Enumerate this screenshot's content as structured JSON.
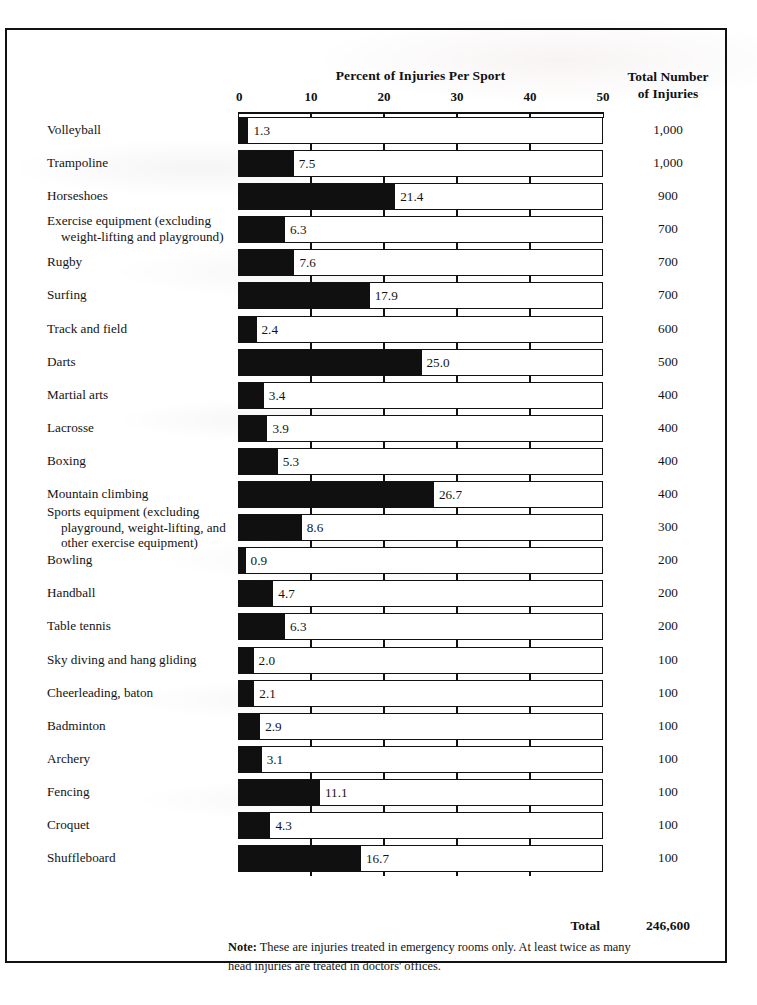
{
  "header": {
    "chart_title": "Percent of Injuries Per Sport",
    "right_column_line1": "Total Number",
    "right_column_line2": "of Injuries"
  },
  "footer": {
    "total_label": "Total",
    "total_value": "246,600",
    "note_prefix": "Note:",
    "note_text": " These are injuries treated in emergency rooms only. At least twice as many head injuries are treated in doctors' offices."
  },
  "chart_data": {
    "type": "bar",
    "title": "Percent of Injuries Per Sport",
    "xlabel": "",
    "ylabel": "",
    "xlim": [
      0,
      50
    ],
    "xticks": [
      0,
      10,
      20,
      30,
      40,
      50
    ],
    "xtick_labels": [
      "0",
      "10",
      "20",
      "30",
      "40",
      "50"
    ],
    "grid": false,
    "legend": "none",
    "orientation": "horizontal",
    "bar_color": "#101010",
    "track_color": "#ffffff",
    "value_series_name": "Percent of Injuries Per Sport",
    "secondary_series_name": "Total Number of Injuries",
    "categories": [
      "Volleyball",
      "Trampoline",
      "Horseshoes",
      "Exercise equipment (excluding weight-lifting and playground)",
      "Rugby",
      "Surfing",
      "Track and field",
      "Darts",
      "Martial arts",
      "Lacrosse",
      "Boxing",
      "Mountain climbing",
      "Sports equipment (excluding playground, weight-lifting, and other exercise equipment)",
      "Bowling",
      "Handball",
      "Table tennis",
      "Sky diving and hang gliding",
      "Cheerleading, baton",
      "Badminton",
      "Archery",
      "Fencing",
      "Croquet",
      "Shuffleboard"
    ],
    "values": [
      1.3,
      7.5,
      21.4,
      6.3,
      7.6,
      17.9,
      2.4,
      25.0,
      3.4,
      3.9,
      5.3,
      26.7,
      8.6,
      0.9,
      4.7,
      6.3,
      2.0,
      2.1,
      2.9,
      3.1,
      11.1,
      4.3,
      16.7
    ],
    "totals": [
      1000,
      1000,
      900,
      700,
      700,
      700,
      600,
      500,
      400,
      400,
      400,
      400,
      300,
      200,
      200,
      200,
      100,
      100,
      100,
      100,
      100,
      100,
      100
    ],
    "total_sum": 246600
  },
  "rows": [
    {
      "label_lines": [
        "Volleyball"
      ],
      "value": "1.3",
      "pct": 1.3,
      "total": "1,000"
    },
    {
      "label_lines": [
        "Trampoline"
      ],
      "value": "7.5",
      "pct": 7.5,
      "total": "1,000"
    },
    {
      "label_lines": [
        "Horseshoes"
      ],
      "value": "21.4",
      "pct": 21.4,
      "total": "900"
    },
    {
      "label_lines": [
        "Exercise equipment (excluding",
        "weight-lifting and playground)"
      ],
      "value": "6.3",
      "pct": 6.3,
      "total": "700"
    },
    {
      "label_lines": [
        "Rugby"
      ],
      "value": "7.6",
      "pct": 7.6,
      "total": "700"
    },
    {
      "label_lines": [
        "Surfing"
      ],
      "value": "17.9",
      "pct": 17.9,
      "total": "700"
    },
    {
      "label_lines": [
        "Track and field"
      ],
      "value": "2.4",
      "pct": 2.4,
      "total": "600"
    },
    {
      "label_lines": [
        "Darts"
      ],
      "value": "25.0",
      "pct": 25.0,
      "total": "500"
    },
    {
      "label_lines": [
        "Martial arts"
      ],
      "value": "3.4",
      "pct": 3.4,
      "total": "400"
    },
    {
      "label_lines": [
        "Lacrosse"
      ],
      "value": "3.9",
      "pct": 3.9,
      "total": "400"
    },
    {
      "label_lines": [
        "Boxing"
      ],
      "value": "5.3",
      "pct": 5.3,
      "total": "400"
    },
    {
      "label_lines": [
        "Mountain climbing"
      ],
      "value": "26.7",
      "pct": 26.7,
      "total": "400"
    },
    {
      "label_lines": [
        "Sports equipment (excluding",
        "playground, weight-lifting, and",
        "other exercise equipment)"
      ],
      "value": "8.6",
      "pct": 8.6,
      "total": "300"
    },
    {
      "label_lines": [
        "Bowling"
      ],
      "value": "0.9",
      "pct": 0.9,
      "total": "200"
    },
    {
      "label_lines": [
        "Handball"
      ],
      "value": "4.7",
      "pct": 4.7,
      "total": "200"
    },
    {
      "label_lines": [
        "Table tennis"
      ],
      "value": "6.3",
      "pct": 6.3,
      "total": "200"
    },
    {
      "label_lines": [
        "Sky diving and hang gliding"
      ],
      "value": "2.0",
      "pct": 2.0,
      "total": "100"
    },
    {
      "label_lines": [
        "Cheerleading, baton"
      ],
      "value": "2.1",
      "pct": 2.1,
      "total": "100"
    },
    {
      "label_lines": [
        "Badminton"
      ],
      "value": "2.9",
      "pct": 2.9,
      "total": "100"
    },
    {
      "label_lines": [
        "Archery"
      ],
      "value": "3.1",
      "pct": 3.1,
      "total": "100"
    },
    {
      "label_lines": [
        "Fencing"
      ],
      "value": "11.1",
      "pct": 11.1,
      "total": "100"
    },
    {
      "label_lines": [
        "Croquet"
      ],
      "value": "4.3",
      "pct": 4.3,
      "total": "100"
    },
    {
      "label_lines": [
        "Shuffleboard"
      ],
      "value": "16.7",
      "pct": 16.7,
      "total": "100"
    }
  ]
}
